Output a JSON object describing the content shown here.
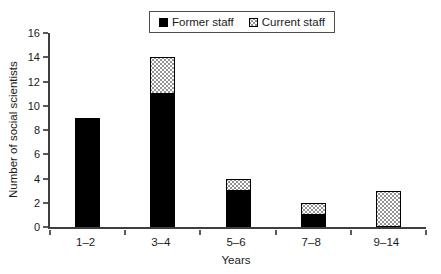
{
  "chart_data": {
    "type": "bar",
    "stacked": true,
    "title": "",
    "xlabel": "Years",
    "ylabel": "Number of social scientists",
    "categories": [
      "1–2",
      "3–4",
      "5–6",
      "7–8",
      "9–14"
    ],
    "series": [
      {
        "name": "Former staff",
        "style": "solid",
        "values": [
          9,
          11,
          3,
          1,
          0
        ]
      },
      {
        "name": "Current staff",
        "style": "stipple",
        "values": [
          0,
          3,
          1,
          1,
          3
        ]
      }
    ],
    "totals": [
      9,
      14,
      4,
      2,
      3
    ],
    "ylim": [
      0,
      16
    ],
    "yticks": [
      0,
      2,
      4,
      6,
      8,
      10,
      12,
      14,
      16
    ],
    "grid": false,
    "legend_position": "top-center"
  },
  "legend": {
    "items": [
      {
        "label": "Former staff",
        "swatch": "solid-black-square"
      },
      {
        "label": "Current staff",
        "swatch": "stipple-square"
      }
    ]
  },
  "colors": {
    "former_staff": "#000000",
    "current_staff_fill": "#ffffff",
    "current_staff_dots": "#8c8c8c",
    "axis": "#3f3f3f",
    "text": "#1a1a1a",
    "background": "#ffffff",
    "legend_border": "#4d4d4d"
  }
}
